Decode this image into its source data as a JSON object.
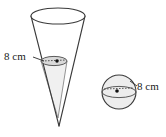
{
  "figure": {
    "background_color": "#ffffff",
    "stroke_color": "#3a3a3a",
    "fill_light": "#f2f2f2",
    "fill_white": "#ffffff",
    "dash_color": "#555555"
  },
  "cone": {
    "name": "cone",
    "label": "8 cm",
    "label_value": 8,
    "label_unit": "cm",
    "measure": "diameter of inner circle",
    "top_ellipse": {
      "cx": 58,
      "cy": 16,
      "rx": 27,
      "ry": 8
    },
    "apex": {
      "x": 59,
      "y": 126
    },
    "inner_ellipse": {
      "cx": 54,
      "cy": 61,
      "rx": 13,
      "ry": 4.5
    },
    "inner_apex": {
      "x": 58,
      "y": 118
    },
    "center_dot": {
      "x": 57,
      "y": 61
    }
  },
  "sphere": {
    "name": "sphere",
    "label": "8 cm",
    "label_value": 8,
    "label_unit": "cm",
    "measure": "diameter",
    "circle": {
      "cx": 119,
      "cy": 92,
      "r": 17
    },
    "equator": {
      "cx": 119,
      "cy": 92,
      "rx": 17,
      "ry": 5.5
    },
    "center_dot": {
      "x": 117,
      "y": 92
    }
  },
  "labels": {
    "cone_label_text": "8 cm",
    "sphere_label_text": "8 cm"
  }
}
